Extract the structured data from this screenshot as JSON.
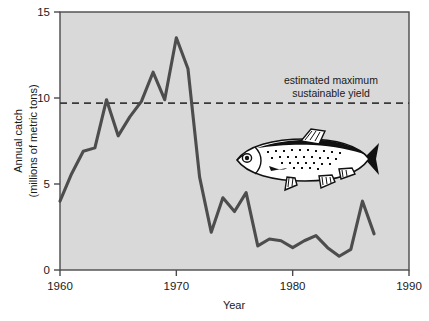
{
  "chart_data": {
    "type": "line",
    "title": "",
    "xlabel": "Year",
    "ylabel": "Annual catch\n(millions of metric tons)",
    "ylabel_line1": "Annual catch",
    "ylabel_line2": "(millions of metric tons)",
    "xlim": [
      1960,
      1990
    ],
    "ylim": [
      0,
      15
    ],
    "xticks": [
      1960,
      1970,
      1980,
      1990
    ],
    "yticks": [
      0,
      5,
      10,
      15
    ],
    "xtick_labels": [
      "1960",
      "1970",
      "1980",
      "1990"
    ],
    "ytick_labels": [
      "0",
      "5",
      "10",
      "15"
    ],
    "grid": false,
    "legend": "none",
    "series": [
      {
        "name": "Annual catch",
        "color": "#4d4d4d",
        "x": [
          1960,
          1961,
          1962,
          1963,
          1964,
          1965,
          1966,
          1967,
          1968,
          1969,
          1970,
          1971,
          1972,
          1973,
          1974,
          1975,
          1976,
          1977,
          1978,
          1979,
          1980,
          1981,
          1982,
          1983,
          1984,
          1985,
          1986,
          1987
        ],
        "values": [
          4.0,
          5.6,
          6.9,
          7.1,
          9.9,
          7.8,
          8.9,
          9.8,
          11.5,
          9.9,
          13.5,
          11.7,
          5.4,
          2.2,
          4.2,
          3.4,
          4.5,
          1.4,
          1.8,
          1.7,
          1.3,
          1.7,
          2.0,
          1.3,
          0.8,
          1.2,
          4.0,
          2.1
        ]
      }
    ],
    "reference_line": {
      "label_line1": "estimated maximum",
      "label_line2": "sustainable yield",
      "value": 9.7,
      "style": "dashed",
      "color": "#3a3a3a"
    },
    "illustration": {
      "name": "sardine-fish-illustration",
      "description": "anchoveta fish drawing"
    },
    "plot_background": "#d9d9d9",
    "frame_color": "#4a4a4a"
  }
}
